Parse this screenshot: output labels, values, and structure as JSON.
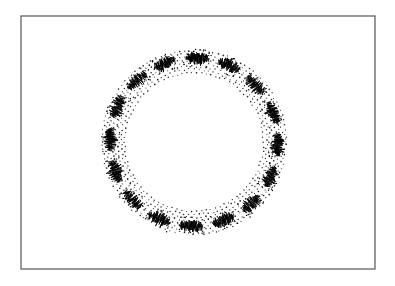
{
  "figure": {
    "width": 395,
    "height": 286,
    "frame": {
      "x": 21,
      "y": 16,
      "width": 354,
      "height": 253,
      "stroke": "#555555"
    },
    "ring": {
      "center_x": 194,
      "center_y": 142,
      "inner_radius": 68,
      "outer_radius": 93,
      "dot_color": "#222222",
      "dot_rings": 8,
      "dots_per_ring": 120
    },
    "tufts": {
      "count": 16,
      "start_angle_deg": -88,
      "radius": 84,
      "color": "#000000",
      "segments": 22,
      "length": 22,
      "amplitude": 7
    }
  }
}
